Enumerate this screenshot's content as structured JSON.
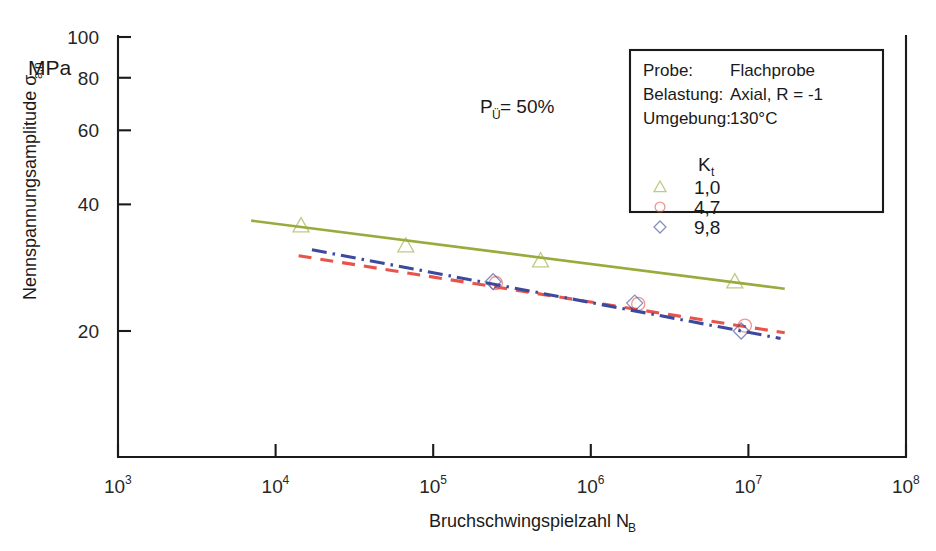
{
  "chart_data": {
    "type": "line",
    "title": "",
    "xlabel": "Bruchschwingspielzahl N",
    "xlabel_sub": "B",
    "ylabel": "Nennspannungsamplitude σ",
    "ylabel_sub": "a,n",
    "yunit": "MPa",
    "xscale": "log",
    "yscale": "log",
    "xlim": [
      1000,
      100000000
    ],
    "ylim": [
      10,
      100
    ],
    "grid": false,
    "xticks": [
      {
        "value": 1000,
        "mantissa": "10",
        "exponent": "3"
      },
      {
        "value": 10000,
        "mantissa": "10",
        "exponent": "4"
      },
      {
        "value": 100000,
        "mantissa": "10",
        "exponent": "5"
      },
      {
        "value": 1000000,
        "mantissa": "10",
        "exponent": "6"
      },
      {
        "value": 10000000,
        "mantissa": "10",
        "exponent": "7"
      },
      {
        "value": 100000000,
        "mantissa": "10",
        "exponent": "8"
      }
    ],
    "yticks": [
      {
        "value": 20,
        "label": "20"
      },
      {
        "value": 40,
        "label": "40"
      },
      {
        "value": 60,
        "label": "60"
      },
      {
        "value": 80,
        "label": "80"
      },
      {
        "value": 100,
        "label": "100"
      }
    ],
    "series": [
      {
        "name": "Kt = 1,0",
        "kt": "1,0",
        "color": "#9aaa3c",
        "linestyle": "solid",
        "marker": "triangle",
        "line": [
          {
            "x": 7000,
            "y": 36.6
          },
          {
            "x": 17000000,
            "y": 25.2
          }
        ],
        "points": [
          {
            "x": 14500,
            "y": 35.6
          },
          {
            "x": 67000,
            "y": 31.9
          },
          {
            "x": 480000,
            "y": 29.4
          },
          {
            "x": 8200000,
            "y": 26.2
          }
        ]
      },
      {
        "name": "Kt = 4,7",
        "kt": "4,7",
        "color": "#e8544a",
        "linestyle": "dashed",
        "marker": "circle",
        "line": [
          {
            "x": 14000,
            "y": 30.2
          },
          {
            "x": 17000000,
            "y": 19.8
          }
        ],
        "points": [
          {
            "x": 250000,
            "y": 26.0
          },
          {
            "x": 2000000,
            "y": 23.2
          },
          {
            "x": 9500000,
            "y": 20.6
          }
        ]
      },
      {
        "name": "Kt = 9,8",
        "kt": "9,8",
        "color": "#3b4a9e",
        "linestyle": "dashdot",
        "marker": "diamond",
        "line": [
          {
            "x": 17000,
            "y": 31.2
          },
          {
            "x": 16000000,
            "y": 19.2
          }
        ],
        "points": [
          {
            "x": 240000,
            "y": 26.2
          },
          {
            "x": 1900000,
            "y": 23.3
          },
          {
            "x": 9000000,
            "y": 20.0
          }
        ]
      }
    ],
    "annotations": [
      {
        "name": "survival-probability",
        "text": "P",
        "sub": "Ü",
        "rest": "= 50%",
        "x": 480,
        "y": 113
      }
    ]
  },
  "legend": {
    "rows": [
      {
        "label": "Probe:",
        "value": "Flachprobe"
      },
      {
        "label": "Belastung:",
        "value": "Axial, R = -1"
      },
      {
        "label": "Umgebung:",
        "value": "130°C"
      }
    ],
    "kt_header": "K",
    "kt_header_sub": "t",
    "entries": [
      {
        "marker": "triangle",
        "color": "#9aaa3c",
        "value": "1,0"
      },
      {
        "marker": "circle",
        "color": "#e8544a",
        "value": "4,7"
      },
      {
        "marker": "diamond",
        "color": "#3b4a9e",
        "value": "9,8"
      }
    ]
  }
}
